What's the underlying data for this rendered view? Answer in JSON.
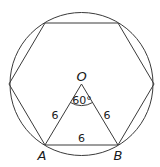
{
  "diagram": {
    "colors": {
      "stroke": "#3a3a3a",
      "text": "#1a1a1a",
      "background": "#ffffff"
    },
    "points": {
      "O": {
        "label": "O"
      },
      "A": {
        "label": "A"
      },
      "B": {
        "label": "B"
      }
    },
    "labels": {
      "OA_length": "6",
      "OB_length": "6",
      "AB_length": "6",
      "angle_AOB": "60°"
    }
  }
}
